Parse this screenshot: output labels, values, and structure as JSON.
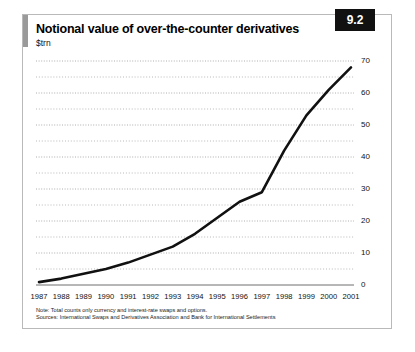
{
  "figure": {
    "title": "Notional value of over-the-counter derivatives",
    "subtitle": "$trn",
    "badge": "9.2",
    "note": "Note: Total counts only currency and interest-rate swaps and options.",
    "source": "Sources: International Swaps and Derivatives Association and Bank for International Settlements",
    "colors": {
      "line": "#111111",
      "accent_bar": "#9a9a9a",
      "badge_bg": "#111111",
      "frame": "#b9b9b9",
      "gridline": "#9b9b9b",
      "axis": "#6f6f6f"
    }
  },
  "chart_data": {
    "type": "line",
    "title": "Notional value of over-the-counter derivatives",
    "subtitle": "$trn",
    "xlabel": "",
    "ylabel": "$trn",
    "x": [
      1987,
      1988,
      1989,
      1990,
      1991,
      1992,
      1993,
      1994,
      1995,
      1996,
      1997,
      1998,
      1999,
      2000,
      2001
    ],
    "categories": [
      "1987",
      "1988",
      "1989",
      "1990",
      "1991",
      "1992",
      "1993",
      "1994",
      "1995",
      "1996",
      "1997",
      "1998",
      "1999",
      "2000",
      "2001"
    ],
    "values": [
      0.9,
      2.0,
      3.5,
      5.0,
      7.0,
      9.5,
      12.0,
      16.0,
      21.0,
      26.0,
      29.0,
      42.0,
      53.0,
      61.0,
      68.0
    ],
    "series": [
      {
        "name": "Notional value",
        "values": [
          0.9,
          2.0,
          3.5,
          5.0,
          7.0,
          9.5,
          12.0,
          16.0,
          21.0,
          26.0,
          29.0,
          42.0,
          53.0,
          61.0,
          68.0
        ]
      }
    ],
    "yticks": [
      0,
      10,
      20,
      30,
      40,
      50,
      60,
      70
    ],
    "ytick_labels": [
      "0",
      "10",
      "20",
      "30",
      "40",
      "50",
      "60",
      "70"
    ],
    "ylim": [
      0,
      70
    ],
    "xlim": [
      1987,
      2001
    ],
    "grid": true,
    "grid_style": "dotted-horizontal",
    "minor_grid": true,
    "legend": false,
    "legend_position": "none",
    "annotations": []
  }
}
